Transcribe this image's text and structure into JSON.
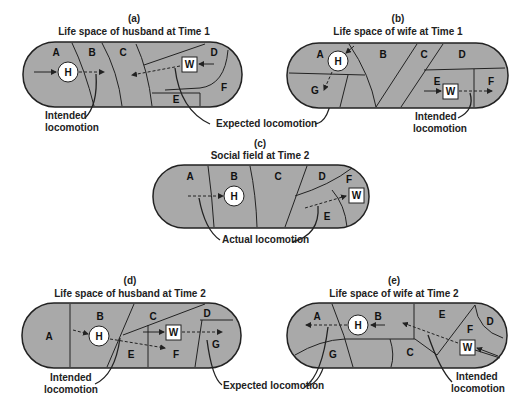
{
  "figure": {
    "panels": [
      {
        "id": "a",
        "letter": "(a)",
        "title": "Life space of husband at Time 1",
        "regions": [
          "A",
          "B",
          "C",
          "D",
          "E",
          "F"
        ],
        "person_h": "H",
        "person_w": "W"
      },
      {
        "id": "b",
        "letter": "(b)",
        "title": "Life space of wife at Time 1",
        "regions": [
          "A",
          "B",
          "C",
          "D",
          "E",
          "F",
          "G"
        ],
        "person_h": "H",
        "person_w": "W"
      },
      {
        "id": "c",
        "letter": "(c)",
        "title": "Social field at Time 2",
        "regions": [
          "A",
          "B",
          "C",
          "D",
          "E",
          "F"
        ],
        "person_h": "H",
        "person_w": "W"
      },
      {
        "id": "d",
        "letter": "(d)",
        "title": "Life space of husband at Time 2",
        "regions": [
          "A",
          "B",
          "C",
          "D",
          "E",
          "F",
          "G"
        ],
        "person_h": "H",
        "person_w": "W"
      },
      {
        "id": "e",
        "letter": "(e)",
        "title": "Life space of wife at Time 2",
        "regions": [
          "A",
          "B",
          "C",
          "D",
          "E",
          "F",
          "G"
        ],
        "person_h": "H",
        "person_w": "W"
      }
    ],
    "annotations": {
      "intended_locomotion_line1": "Intended",
      "intended_locomotion_line2": "locomotion",
      "expected_locomotion": "Expected locomotion",
      "actual_locomotion": "Actual locomotion"
    },
    "colors": {
      "region_fill": "#a9a9a9",
      "stroke": "#222222",
      "node_fill": "#ffffff"
    }
  }
}
